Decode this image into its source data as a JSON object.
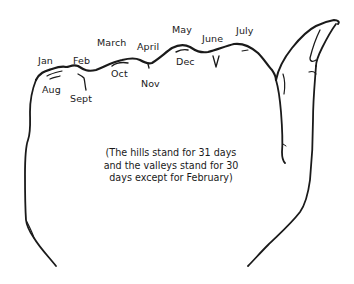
{
  "diagram": {
    "hills_labels": [
      {
        "label": "Jan"
      },
      {
        "label": "Feb"
      },
      {
        "label": "March"
      },
      {
        "label": "April"
      },
      {
        "label": "May"
      },
      {
        "label": "June"
      },
      {
        "label": "July"
      }
    ],
    "knuckle_labels": [
      {
        "label": "Jan"
      },
      {
        "label": "March"
      },
      {
        "label": "May"
      },
      {
        "label": "July"
      }
    ],
    "valley_labels": [
      {
        "label": "Feb"
      },
      {
        "label": "April"
      },
      {
        "label": "June"
      }
    ],
    "lower_labels": [
      {
        "label": "Aug"
      },
      {
        "label": "Sept"
      },
      {
        "label": "Oct"
      },
      {
        "label": "Nov"
      },
      {
        "label": "Dec"
      }
    ],
    "caption": {
      "lines": [
        "(The hills stand for 31 days",
        "and the valleys stand for 30",
        "days except for February)"
      ]
    },
    "colors": {
      "ink": "#1a1a1a",
      "background": "#ffffff"
    }
  }
}
